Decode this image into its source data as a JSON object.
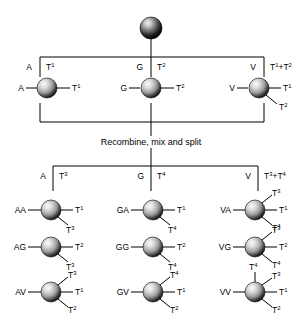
{
  "figure": {
    "caption": "Recombine, mix and split",
    "colors": {
      "line": "#000000",
      "bead_highlight": "#f2f2f2",
      "bead_mid": "#9a9a9a",
      "bead_dark": "#1a1a1a",
      "background": "#ffffff"
    }
  },
  "start_bead": {
    "label": "",
    "tags": []
  },
  "split1": {
    "columns": [
      {
        "residue": "A",
        "tag": "T",
        "tag_sup": "1",
        "tag_text": "T1"
      },
      {
        "residue": "G",
        "tag": "T",
        "tag_sup": "2",
        "tag_text": "T2"
      },
      {
        "residue": "V",
        "tag": "T",
        "tag_sup": "1+2",
        "tag_text": "T1+T2"
      }
    ]
  },
  "row1": [
    {
      "name": "A",
      "left_label": "A",
      "branches": [
        {
          "tag": "T",
          "sup": "1",
          "dir": "right"
        }
      ]
    },
    {
      "name": "G",
      "left_label": "G",
      "branches": [
        {
          "tag": "T",
          "sup": "2",
          "dir": "right"
        }
      ]
    },
    {
      "name": "V",
      "left_label": "V",
      "branches": [
        {
          "tag": "T",
          "sup": "1",
          "dir": "right"
        },
        {
          "tag": "T",
          "sup": "2",
          "dir": "down"
        }
      ]
    }
  ],
  "split2": {
    "columns": [
      {
        "residue": "A",
        "tag": "T",
        "tag_sup": "3",
        "tag_text": "T3"
      },
      {
        "residue": "G",
        "tag": "T",
        "tag_sup": "4",
        "tag_text": "T4"
      },
      {
        "residue": "V",
        "tag": "T",
        "tag_sup": "3+4",
        "tag_text": "T3+T4"
      }
    ]
  },
  "products": [
    [
      {
        "left_label": "AA",
        "branches": [
          {
            "tag": "T",
            "sup": "1",
            "dir": "right"
          },
          {
            "tag": "T",
            "sup": "3",
            "dir": "down"
          }
        ]
      },
      {
        "left_label": "GA",
        "branches": [
          {
            "tag": "T",
            "sup": "1",
            "dir": "right"
          },
          {
            "tag": "T",
            "sup": "4",
            "dir": "down"
          }
        ]
      },
      {
        "left_label": "VA",
        "branches": [
          {
            "tag": "T",
            "sup": "3",
            "dir": "up"
          },
          {
            "tag": "T",
            "sup": "1",
            "dir": "right"
          },
          {
            "tag": "T",
            "sup": "4",
            "dir": "down"
          }
        ]
      }
    ],
    [
      {
        "left_label": "AG",
        "branches": [
          {
            "tag": "T",
            "sup": "2",
            "dir": "right"
          },
          {
            "tag": "T",
            "sup": "3",
            "dir": "down"
          }
        ]
      },
      {
        "left_label": "GG",
        "branches": [
          {
            "tag": "T",
            "sup": "2",
            "dir": "right"
          },
          {
            "tag": "T",
            "sup": "4",
            "dir": "down"
          }
        ]
      },
      {
        "left_label": "VG",
        "branches": [
          {
            "tag": "T",
            "sup": "3",
            "dir": "up"
          },
          {
            "tag": "T",
            "sup": "2",
            "dir": "right"
          },
          {
            "tag": "T",
            "sup": "4",
            "dir": "down"
          }
        ]
      }
    ],
    [
      {
        "left_label": "AV",
        "branches": [
          {
            "tag": "T",
            "sup": "3",
            "dir": "up"
          },
          {
            "tag": "T",
            "sup": "1",
            "dir": "right"
          },
          {
            "tag": "T",
            "sup": "2",
            "dir": "down"
          }
        ]
      },
      {
        "left_label": "GV",
        "branches": [
          {
            "tag": "T",
            "sup": "4",
            "dir": "up"
          },
          {
            "tag": "T",
            "sup": "1",
            "dir": "right"
          },
          {
            "tag": "T",
            "sup": "2",
            "dir": "down"
          }
        ]
      },
      {
        "left_label": "VV",
        "branches": [
          {
            "tag": "T",
            "sup": "4",
            "dir": "up2"
          },
          {
            "tag": "T",
            "sup": "3",
            "dir": "up"
          },
          {
            "tag": "T",
            "sup": "1",
            "dir": "right"
          },
          {
            "tag": "T",
            "sup": "2",
            "dir": "down"
          }
        ]
      }
    ]
  ]
}
